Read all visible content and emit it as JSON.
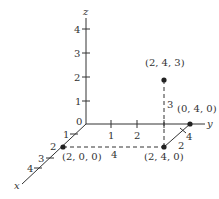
{
  "diagram": {
    "type": "3d-coordinate-axes",
    "colors": {
      "ink": "#333333",
      "background": "#ffffff"
    },
    "axes": {
      "x": {
        "label": "x",
        "ticks": [
          "1",
          "2",
          "3",
          "4"
        ]
      },
      "y": {
        "label": "y",
        "ticks": [
          "1",
          "2"
        ]
      },
      "z": {
        "label": "z",
        "ticks": [
          "1",
          "2",
          "3",
          "4"
        ]
      },
      "origin_label": "0"
    },
    "points": [
      {
        "label": "(2, 0, 0)"
      },
      {
        "label": "(2, 4, 0)"
      },
      {
        "label": "(0, 4, 0)"
      },
      {
        "label": "(2, 4, 3)"
      }
    ],
    "segment_labels": {
      "x_dashed_length": "4",
      "y_dashed_length": "2",
      "y_edge_tick": "4",
      "vertical_height": "3"
    }
  }
}
